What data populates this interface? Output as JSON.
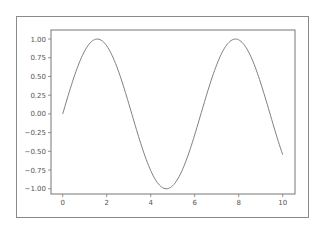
{
  "chart_data": {
    "type": "line",
    "title": "",
    "xlabel": "",
    "ylabel": "",
    "function": "sin(x)",
    "xlim": [
      -0.5,
      10.5
    ],
    "ylim": [
      -1.1,
      1.1
    ],
    "grid": false,
    "legend": null,
    "x_ticks": [
      "0",
      "2",
      "4",
      "6",
      "8",
      "10"
    ],
    "y_ticks": [
      "1.00",
      "0.75",
      "0.50",
      "0.25",
      "0.00",
      "−0.25",
      "−0.50",
      "−0.75",
      "−1.00"
    ],
    "series": [
      {
        "name": "sin(x)",
        "color": "#808080",
        "x": [
          0,
          0.5,
          1,
          1.5,
          2,
          2.5,
          3,
          3.5,
          4,
          4.5,
          5,
          5.5,
          6,
          6.5,
          7,
          7.5,
          8,
          8.5,
          9,
          9.5,
          10
        ],
        "y": [
          0.0,
          0.479,
          0.841,
          0.997,
          0.909,
          0.598,
          0.141,
          -0.351,
          -0.757,
          -0.978,
          -0.959,
          -0.706,
          -0.279,
          0.215,
          0.657,
          0.938,
          0.989,
          0.798,
          0.412,
          -0.075,
          -0.544
        ]
      }
    ]
  },
  "colors": {
    "line": "#808080",
    "axes": "#777777",
    "frame": "#8a8a8a",
    "text": "#555555"
  }
}
